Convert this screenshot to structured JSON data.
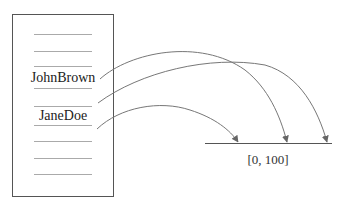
{
  "diagram": {
    "table": {
      "slots": [
        {
          "label": ""
        },
        {
          "label": ""
        },
        {
          "label": "JohnBrown"
        },
        {
          "label": "JaneDoe"
        },
        {
          "label": ""
        },
        {
          "label": ""
        },
        {
          "label": ""
        }
      ]
    },
    "range_label": "[0, 100]",
    "colors": {
      "box": "#555555",
      "slot_line": "#aaaaaa",
      "arrow": "#777777",
      "range_line": "#555555"
    }
  }
}
